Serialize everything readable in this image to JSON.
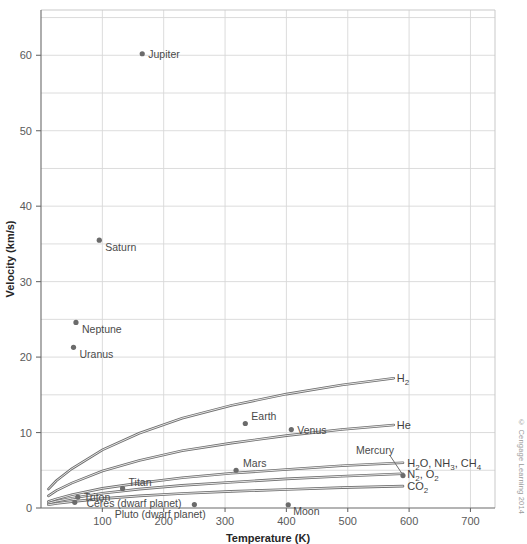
{
  "chart_data": {
    "type": "scatter",
    "title": "",
    "xlabel": "Temperature (K)",
    "ylabel": "Velocity (km/s)",
    "xlim": [
      0,
      740
    ],
    "ylim": [
      0,
      66
    ],
    "xticks": [
      100,
      200,
      300,
      400,
      500,
      600,
      700
    ],
    "yticks": [
      0,
      10,
      20,
      30,
      40,
      50,
      60
    ],
    "grid": true,
    "minor_grid_step": 5,
    "legend": "none",
    "points": [
      {
        "label": "Jupiter",
        "x": 165,
        "y": 60.2,
        "label_dx": 6,
        "label_dy": 4
      },
      {
        "label": "Saturn",
        "x": 95,
        "y": 35.5,
        "label_dx": 6,
        "label_dy": 11
      },
      {
        "label": "Neptune",
        "x": 57,
        "y": 24.6,
        "label_dx": 6,
        "label_dy": 11
      },
      {
        "label": "Uranus",
        "x": 53,
        "y": 21.3,
        "label_dx": 6,
        "label_dy": 11
      },
      {
        "label": "Earth",
        "x": 333,
        "y": 11.2,
        "label_dx": 6,
        "label_dy": -3
      },
      {
        "label": "Venus",
        "x": 408,
        "y": 10.4,
        "label_dx": 6,
        "label_dy": 4
      },
      {
        "label": "Mars",
        "x": 318,
        "y": 5.0,
        "label_dx": 7,
        "label_dy": -3
      },
      {
        "label": "Titan",
        "x": 133,
        "y": 2.6,
        "label_dx": 6,
        "label_dy": -2
      },
      {
        "label": "Triton",
        "x": 60,
        "y": 1.45,
        "label_dx": 6,
        "label_dy": 4
      },
      {
        "label": "Moon",
        "x": 403,
        "y": 0.43,
        "label_dx": 5,
        "label_dy": 10
      },
      {
        "label": "Ceres (dwarf planet)",
        "x": 250,
        "y": 0.45,
        "label_dx": -108,
        "label_dy": 2
      },
      {
        "label": "Pluto (dwarf planet)",
        "x": 55,
        "y": 0.75,
        "label_dx": 40,
        "label_dy": 16
      },
      {
        "label": "Mercury",
        "x": 590,
        "y": 4.3,
        "label_dx": -47,
        "label_dy": -22
      }
    ],
    "curves": [
      {
        "name": "H2",
        "label": "H",
        "sub": "2",
        "sup": "",
        "x": [
          12,
          25,
          50,
          100,
          160,
          230,
          310,
          400,
          490,
          575
        ],
        "y": [
          2.5,
          3.6,
          5.2,
          7.7,
          9.9,
          11.9,
          13.6,
          15.1,
          16.3,
          17.2
        ]
      },
      {
        "name": "He",
        "label": "He",
        "sub": "",
        "sup": "",
        "x": [
          12,
          25,
          50,
          100,
          160,
          230,
          310,
          400,
          490,
          575
        ],
        "y": [
          1.6,
          2.3,
          3.3,
          4.9,
          6.3,
          7.6,
          8.6,
          9.6,
          10.4,
          11.0
        ]
      },
      {
        "name": "H2O, NH3, CH4",
        "label": "H2O, NH3, CH4",
        "sub": "",
        "sup": "",
        "x": [
          12,
          25,
          50,
          100,
          160,
          230,
          310,
          400,
          490,
          590
        ],
        "y": [
          0.85,
          1.2,
          1.75,
          2.6,
          3.3,
          4.0,
          4.6,
          5.1,
          5.6,
          6.0
        ]
      },
      {
        "name": "N2, O2",
        "label": "N2, O2",
        "sub": "",
        "sup": "",
        "x": [
          12,
          25,
          50,
          100,
          160,
          230,
          310,
          400,
          490,
          590
        ],
        "y": [
          0.64,
          0.9,
          1.3,
          1.95,
          2.5,
          3.0,
          3.4,
          3.85,
          4.2,
          4.55
        ]
      },
      {
        "name": "CO2",
        "label": "CO2",
        "sub": "",
        "sup": "",
        "x": [
          12,
          25,
          50,
          100,
          160,
          230,
          310,
          400,
          490,
          590
        ],
        "y": [
          0.42,
          0.6,
          0.85,
          1.25,
          1.6,
          1.92,
          2.2,
          2.45,
          2.7,
          2.9
        ]
      }
    ],
    "curve_labels": [
      {
        "id": "h2",
        "parts": [
          {
            "t": "H",
            "sub": false
          },
          {
            "t": "2",
            "sub": true
          }
        ],
        "x": 580,
        "y": 17.2
      },
      {
        "id": "he",
        "parts": [
          {
            "t": "He",
            "sub": false
          }
        ],
        "x": 580,
        "y": 11.0
      },
      {
        "id": "hydrides",
        "parts": [
          {
            "t": "H",
            "sub": false
          },
          {
            "t": "2",
            "sub": true
          },
          {
            "t": "O, NH",
            "sub": false
          },
          {
            "t": "3",
            "sub": true
          },
          {
            "t": ", CH",
            "sub": false
          },
          {
            "t": "4",
            "sub": true
          }
        ],
        "x": 597,
        "y": 6.0
      },
      {
        "id": "n2o2",
        "parts": [
          {
            "t": "N",
            "sub": false
          },
          {
            "t": "2",
            "sub": true
          },
          {
            "t": ", O",
            "sub": false
          },
          {
            "t": "2",
            "sub": true
          }
        ],
        "x": 597,
        "y": 4.55
      },
      {
        "id": "co2",
        "parts": [
          {
            "t": "CO",
            "sub": false
          },
          {
            "t": "2",
            "sub": true
          }
        ],
        "x": 597,
        "y": 2.9
      }
    ]
  },
  "credit": "© Cengage Learning 2014"
}
